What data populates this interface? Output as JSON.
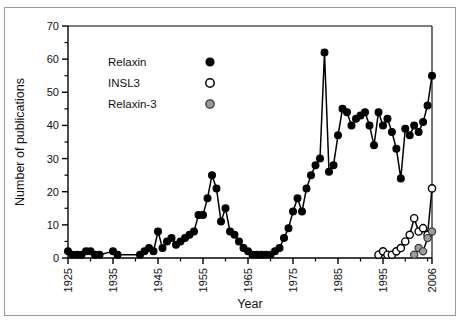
{
  "chart_data": {
    "type": "line",
    "title": "",
    "xlabel": "Year",
    "ylabel": "Number of publications",
    "xlim": [
      1925,
      2006
    ],
    "ylim": [
      0,
      70
    ],
    "xticks": [
      1925,
      1935,
      1945,
      1955,
      1965,
      1975,
      1985,
      1995,
      2006
    ],
    "xtick_labels": [
      "1925",
      "1935",
      "1945",
      "1955",
      "1965",
      "1975",
      "1985",
      "1995",
      "2006"
    ],
    "xminor_step": 5,
    "yticks": [
      0,
      10,
      20,
      30,
      40,
      50,
      60,
      70
    ],
    "ytick_labels": [
      "0",
      "10",
      "20",
      "30",
      "40",
      "50",
      "60",
      "70"
    ],
    "yminor_step": 5,
    "grid": false,
    "legend_position": "upper-left-inside",
    "series": [
      {
        "name": "Relaxin",
        "marker": "filled-circle",
        "color": "#000000",
        "x": [
          1925,
          1926,
          1927,
          1928,
          1929,
          1930,
          1931,
          1932,
          1935,
          1936,
          1941,
          1942,
          1943,
          1944,
          1945,
          1946,
          1947,
          1948,
          1949,
          1950,
          1951,
          1952,
          1953,
          1954,
          1955,
          1956,
          1957,
          1958,
          1959,
          1960,
          1961,
          1962,
          1963,
          1964,
          1965,
          1966,
          1967,
          1968,
          1969,
          1970,
          1971,
          1972,
          1973,
          1974,
          1975,
          1976,
          1977,
          1978,
          1979,
          1980,
          1981,
          1982,
          1983,
          1984,
          1985,
          1986,
          1987,
          1988,
          1989,
          1990,
          1991,
          1992,
          1993,
          1994,
          1995,
          1996,
          1997,
          1998,
          1999,
          2000,
          2001,
          2002,
          2003,
          2004,
          2005,
          2006
        ],
        "y": [
          2,
          1,
          1,
          1,
          2,
          2,
          1,
          1,
          2,
          1,
          1,
          2,
          3,
          2,
          8,
          3,
          5,
          6,
          4,
          5,
          6,
          7,
          8,
          13,
          13,
          18,
          25,
          21,
          11,
          15,
          8,
          7,
          5,
          3,
          2,
          1,
          1,
          1,
          1,
          1,
          2,
          3,
          6,
          9,
          14,
          18,
          14,
          21,
          25,
          28,
          30,
          62,
          26,
          28,
          37,
          45,
          44,
          40,
          42,
          43,
          44,
          40,
          34,
          44,
          40,
          42,
          38,
          33,
          24,
          39,
          37,
          40,
          38,
          41,
          46,
          55
        ]
      },
      {
        "name": "INSL3",
        "marker": "open-circle",
        "color": "#ffffff",
        "x": [
          1994,
          1995,
          1996,
          1997,
          1998,
          1999,
          2000,
          2001,
          2002,
          2003,
          2004,
          2005,
          2006
        ],
        "y": [
          1,
          2,
          1,
          1,
          2,
          3,
          5,
          7,
          12,
          8,
          9,
          7,
          21
        ]
      },
      {
        "name": "Relaxin-3",
        "marker": "gray-circle",
        "color": "#9b9b9b",
        "x": [
          2002,
          2003,
          2004,
          2005,
          2006
        ],
        "y": [
          1,
          3,
          2,
          6,
          8
        ]
      }
    ]
  },
  "legend": {
    "items": [
      {
        "label": "Relaxin",
        "marker": "filled-circle"
      },
      {
        "label": "INSL3",
        "marker": "open-circle"
      },
      {
        "label": "Relaxin-3",
        "marker": "gray-circle"
      }
    ]
  },
  "axes": {
    "x_title": "Year",
    "y_title": "Number of publications"
  }
}
